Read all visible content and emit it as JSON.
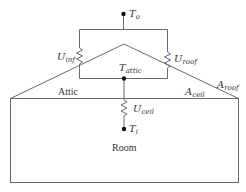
{
  "diagram": {
    "colors": {
      "line": "#6a6a6a",
      "node": "#111111",
      "text": "#333333"
    },
    "nodes": {
      "outdoor": {
        "symbol": "T",
        "sub": "o"
      },
      "attic": {
        "symbol": "T",
        "sub": "attic"
      },
      "indoor": {
        "symbol": "T",
        "sub": "i"
      }
    },
    "resistors": {
      "infiltration": {
        "symbol": "U",
        "sub": "inf"
      },
      "roof": {
        "symbol": "U",
        "sub": "roof"
      },
      "ceiling": {
        "symbol": "U",
        "sub": "ceil"
      }
    },
    "areas": {
      "roof": {
        "symbol": "A",
        "sub": "roof"
      },
      "ceiling": {
        "symbol": "A",
        "sub": "ceil"
      }
    },
    "zones": {
      "attic": "Attic",
      "room": "Room"
    }
  }
}
